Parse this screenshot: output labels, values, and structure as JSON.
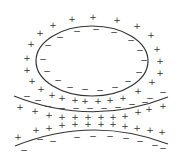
{
  "diagram": {
    "title": "",
    "line_color": "#333333",
    "background": "#ffffff",
    "ellipse": {
      "cx": 92,
      "cy": 61,
      "rx": 56,
      "ry": 35
    },
    "upper_curve": {
      "d": "M14,96 Q92,127 168,97"
    },
    "lower_curve": {
      "d": "M15,146 Q92,115 168,144"
    },
    "plus_symbol": "+",
    "minus_symbol": "−",
    "plus_positions": [
      [
        53,
        25
      ],
      [
        72,
        19
      ],
      [
        93,
        17
      ],
      [
        117,
        20
      ],
      [
        137,
        26
      ],
      [
        151,
        35
      ],
      [
        157,
        49
      ],
      [
        160,
        61
      ],
      [
        160,
        73
      ],
      [
        152,
        82
      ],
      [
        40,
        33
      ],
      [
        31,
        44
      ],
      [
        27,
        58
      ],
      [
        27,
        70
      ],
      [
        32,
        81
      ],
      [
        41,
        89
      ],
      [
        52,
        95
      ],
      [
        62,
        98
      ],
      [
        75,
        100
      ],
      [
        85,
        101
      ],
      [
        98,
        101
      ],
      [
        110,
        100
      ],
      [
        123,
        98
      ],
      [
        138,
        91
      ],
      [
        20,
        107
      ],
      [
        35,
        111
      ],
      [
        49,
        115
      ],
      [
        62,
        117
      ],
      [
        75,
        117
      ],
      [
        88,
        117
      ],
      [
        101,
        117
      ],
      [
        113,
        117
      ],
      [
        125,
        116
      ],
      [
        138,
        112
      ],
      [
        149,
        109
      ],
      [
        163,
        106
      ],
      [
        36,
        130
      ],
      [
        49,
        128
      ],
      [
        62,
        125
      ],
      [
        75,
        124
      ],
      [
        88,
        124
      ],
      [
        101,
        124
      ],
      [
        113,
        124
      ],
      [
        125,
        126
      ],
      [
        137,
        128
      ],
      [
        150,
        130
      ],
      [
        162,
        132
      ],
      [
        18,
        137
      ]
    ],
    "minus_positions": [
      [
        77,
        31
      ],
      [
        60,
        37
      ],
      [
        48,
        45
      ],
      [
        43,
        59
      ],
      [
        47,
        71
      ],
      [
        58,
        80
      ],
      [
        70,
        87
      ],
      [
        85,
        89
      ],
      [
        100,
        90
      ],
      [
        115,
        87
      ],
      [
        128,
        81
      ],
      [
        139,
        72
      ],
      [
        144,
        60
      ],
      [
        140,
        50
      ],
      [
        131,
        40
      ],
      [
        114,
        32
      ],
      [
        96,
        29
      ],
      [
        27,
        96
      ],
      [
        38,
        100
      ],
      [
        163,
        92
      ],
      [
        150,
        98
      ],
      [
        48,
        106
      ],
      [
        62,
        108
      ],
      [
        76,
        108
      ],
      [
        90,
        108
      ],
      [
        104,
        108
      ],
      [
        118,
        107
      ],
      [
        132,
        104
      ],
      [
        145,
        102
      ],
      [
        40,
        139
      ],
      [
        53,
        141
      ],
      [
        77,
        137
      ],
      [
        93,
        136
      ],
      [
        110,
        136
      ],
      [
        126,
        138
      ],
      [
        140,
        141
      ],
      [
        155,
        145
      ],
      [
        163,
        148
      ],
      [
        24,
        150
      ]
    ]
  }
}
